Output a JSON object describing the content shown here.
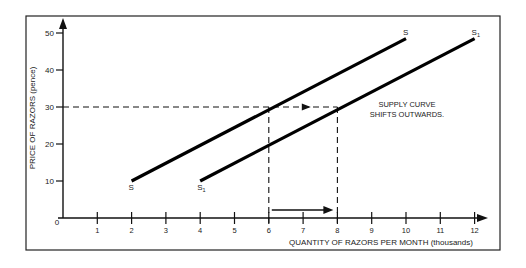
{
  "chart_data": {
    "type": "line",
    "title": "",
    "xlabel": "QUANTITY OF RAZORS PER MONTH (thousands)",
    "ylabel": "PRICE OF RAZORS (pence)",
    "xlim": [
      0,
      12
    ],
    "ylim": [
      0,
      50
    ],
    "x_ticks": [
      "1",
      "2",
      "3",
      "4",
      "5",
      "6",
      "7",
      "8",
      "9",
      "10",
      "11",
      "12"
    ],
    "y_ticks": [
      "10",
      "20",
      "30",
      "40",
      "50"
    ],
    "origin_label": "0",
    "grid": false,
    "series": [
      {
        "name": "S",
        "start_label": "S",
        "end_label": "S",
        "points": [
          [
            2,
            10
          ],
          [
            10,
            48.5
          ]
        ]
      },
      {
        "name": "S1",
        "start_label": "S",
        "end_label": "S",
        "subscript": "1",
        "points": [
          [
            4,
            10
          ],
          [
            12,
            48.5
          ]
        ]
      }
    ],
    "reference_lines": {
      "price_level": 30,
      "quantity_before": 6,
      "quantity_after": 8
    },
    "annotations": {
      "line1": "SUPPLY CURVE",
      "line2": "SHIFTS OUTWARDS."
    }
  }
}
